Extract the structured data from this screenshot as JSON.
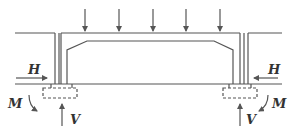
{
  "diagram": {
    "type": "structural-load-diagram",
    "colors": {
      "line": "#555555",
      "text": "#333333",
      "background": "#ffffff"
    },
    "top_load_arrows": 5,
    "labels": {
      "left_horizontal": "H",
      "left_moment": "M",
      "left_vertical": "V",
      "right_horizontal": "H",
      "right_moment": "M",
      "right_vertical": "V"
    }
  }
}
